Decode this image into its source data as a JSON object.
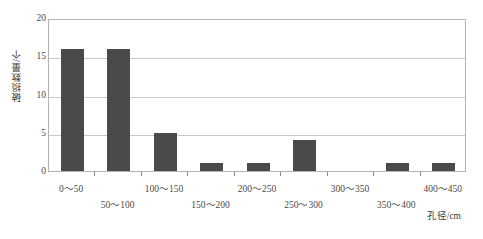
{
  "chart_data": {
    "type": "bar",
    "title": "",
    "subtitle": "",
    "xlabel": "孔径/cm",
    "ylabel": "破损数量/个",
    "categories": [
      "0～50",
      "50～100",
      "100～150",
      "150～200",
      "200～250",
      "250～300",
      "300～350",
      "350～400",
      "400～450"
    ],
    "values": [
      16,
      16,
      5,
      1,
      1,
      4,
      0,
      1,
      1
    ],
    "ylim": [
      0,
      20
    ],
    "yticks": [
      0,
      5,
      10,
      15,
      20
    ],
    "ytick_labels": [
      "0",
      "5",
      "10",
      "15",
      "20"
    ],
    "grid": true,
    "grid_axis": "y",
    "legend": false,
    "legend_position": "none",
    "bar_color": "#4a4a4a",
    "grid_color": "#c8c8c8",
    "axis_border_color": "#b4b4b4",
    "background_color": "#ffffff",
    "x_label_layout": "staggered-two-rows"
  }
}
